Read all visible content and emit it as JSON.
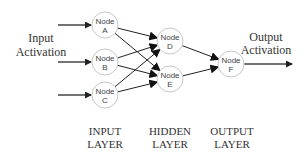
{
  "diagram": {
    "type": "neural-network",
    "input_activation": {
      "line1": "Input",
      "line2": "Activation"
    },
    "output_activation": {
      "line1": "Output",
      "line2": "Activation"
    },
    "nodes": [
      {
        "id": "A",
        "word": "Node",
        "letter": "A",
        "layer": "input",
        "cx": 105,
        "cy": 25,
        "r": 13
      },
      {
        "id": "B",
        "word": "Node",
        "letter": "B",
        "layer": "input",
        "cx": 105,
        "cy": 62,
        "r": 13
      },
      {
        "id": "C",
        "word": "Node",
        "letter": "C",
        "layer": "input",
        "cx": 105,
        "cy": 95,
        "r": 13
      },
      {
        "id": "D",
        "word": "Node",
        "letter": "D",
        "layer": "hidden",
        "cx": 170,
        "cy": 41,
        "r": 13
      },
      {
        "id": "E",
        "word": "Node",
        "letter": "E",
        "layer": "hidden",
        "cx": 170,
        "cy": 79,
        "r": 13
      },
      {
        "id": "F",
        "word": "Node",
        "letter": "F",
        "layer": "output",
        "cx": 231,
        "cy": 64,
        "r": 13
      }
    ],
    "edges": [
      [
        "A",
        "D"
      ],
      [
        "A",
        "E"
      ],
      [
        "B",
        "D"
      ],
      [
        "B",
        "E"
      ],
      [
        "C",
        "D"
      ],
      [
        "C",
        "E"
      ],
      [
        "D",
        "F"
      ],
      [
        "E",
        "F"
      ]
    ],
    "layers": [
      {
        "line1": "INPUT",
        "line2": "LAYER",
        "x": 105
      },
      {
        "line1": "HIDDEN",
        "line2": "LAYER",
        "x": 170
      },
      {
        "line1": "OUTPUT",
        "line2": "LAYER",
        "x": 232
      }
    ],
    "colors": {
      "node_stroke": "#c8c8c8",
      "edge": "#222222",
      "text": "#333333"
    }
  }
}
